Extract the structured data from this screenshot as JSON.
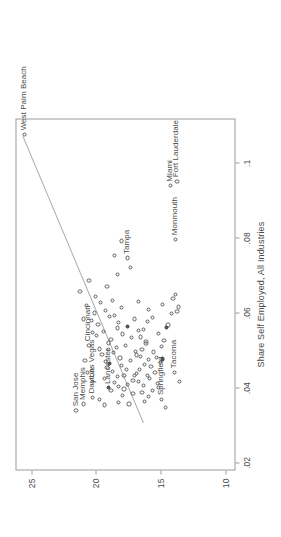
{
  "chart_data": {
    "type": "scatter",
    "title": "",
    "subtitle": "",
    "xlabel": "Share Self Employed, All Industries",
    "ylabel": "",
    "xlim": [
      0.018,
      0.112
    ],
    "ylim": [
      9.2,
      26.2
    ],
    "grid": false,
    "legend": null,
    "xticks": [
      0.02,
      0.04,
      0.06,
      0.08,
      0.1
    ],
    "xticklabels": [
      ".02",
      ".04",
      ".06",
      ".08",
      ".1"
    ],
    "yticks": [
      10,
      15,
      20,
      25
    ],
    "yticklabels": [
      "10",
      "15",
      "20",
      "25"
    ],
    "fit_line": {
      "type": "linear",
      "x": [
        0.0305,
        0.1075
      ],
      "y": [
        16.3,
        25.7
      ],
      "color": "#9b9b9b"
    },
    "annotations": [
      {
        "label": "San Jose",
        "x": 0.0338,
        "y": 21.6,
        "pos": "right"
      },
      {
        "label": "Memphis",
        "x": 0.0355,
        "y": 21.0,
        "pos": "right"
      },
      {
        "label": "Dayton",
        "x": 0.0372,
        "y": 20.3,
        "pos": "right"
      },
      {
        "label": "Las Vegas",
        "x": 0.0415,
        "y": 20.3,
        "pos": "right"
      },
      {
        "label": "Lancaster",
        "x": 0.0398,
        "y": 19.1,
        "pos": "right"
      },
      {
        "label": "Cincinnati",
        "x": 0.0512,
        "y": 20.6,
        "pos": "right"
      },
      {
        "label": "Springfield",
        "x": 0.0368,
        "y": 15.0,
        "pos": "right"
      },
      {
        "label": "Tacoma",
        "x": 0.044,
        "y": 14.0,
        "pos": "right"
      },
      {
        "label": "Tampa",
        "x": 0.0745,
        "y": 17.6,
        "pos": "right"
      },
      {
        "label": "Monmouth",
        "x": 0.0795,
        "y": 13.9,
        "pos": "right"
      },
      {
        "label": "Miami",
        "x": 0.0938,
        "y": 14.3,
        "pos": "right"
      },
      {
        "label": "Fort Lauderdale",
        "x": 0.095,
        "y": 13.8,
        "pos": "right"
      },
      {
        "label": "West Palm Beach",
        "x": 0.1075,
        "y": 25.6,
        "pos": "right"
      }
    ],
    "points": [
      {
        "x": 0.0338,
        "y": 21.6
      },
      {
        "x": 0.0355,
        "y": 21.0
      },
      {
        "x": 0.0372,
        "y": 20.3
      },
      {
        "x": 0.0415,
        "y": 20.3
      },
      {
        "x": 0.0398,
        "y": 19.1,
        "filled": true
      },
      {
        "x": 0.0512,
        "y": 20.6
      },
      {
        "x": 0.0368,
        "y": 15.0
      },
      {
        "x": 0.044,
        "y": 14.0
      },
      {
        "x": 0.0745,
        "y": 17.6
      },
      {
        "x": 0.0795,
        "y": 13.9
      },
      {
        "x": 0.0938,
        "y": 14.3
      },
      {
        "x": 0.095,
        "y": 13.8
      },
      {
        "x": 0.1075,
        "y": 25.6
      },
      {
        "x": 0.0355,
        "y": 17.5
      },
      {
        "x": 0.0362,
        "y": 16.3
      },
      {
        "x": 0.0378,
        "y": 18.0
      },
      {
        "x": 0.0382,
        "y": 17.2
      },
      {
        "x": 0.039,
        "y": 18.9
      },
      {
        "x": 0.0395,
        "y": 17.9
      },
      {
        "x": 0.0402,
        "y": 18.3
      },
      {
        "x": 0.0408,
        "y": 17.6
      },
      {
        "x": 0.0412,
        "y": 18.6
      },
      {
        "x": 0.0418,
        "y": 17.2
      },
      {
        "x": 0.0422,
        "y": 19.4
      },
      {
        "x": 0.0428,
        "y": 18.4
      },
      {
        "x": 0.0432,
        "y": 17.1
      },
      {
        "x": 0.0436,
        "y": 16.9
      },
      {
        "x": 0.0442,
        "y": 18.8
      },
      {
        "x": 0.0448,
        "y": 17.7
      },
      {
        "x": 0.0452,
        "y": 19.2
      },
      {
        "x": 0.0458,
        "y": 18.1
      },
      {
        "x": 0.0462,
        "y": 19.0,
        "filled": true
      },
      {
        "x": 0.0468,
        "y": 19.3
      },
      {
        "x": 0.0472,
        "y": 17.4
      },
      {
        "x": 0.0478,
        "y": 18.2
      },
      {
        "x": 0.0482,
        "y": 16.6
      },
      {
        "x": 0.0488,
        "y": 19.6
      },
      {
        "x": 0.0492,
        "y": 18.7
      },
      {
        "x": 0.0496,
        "y": 17.0
      },
      {
        "x": 0.0502,
        "y": 19.8
      },
      {
        "x": 0.0506,
        "y": 18.5
      },
      {
        "x": 0.0512,
        "y": 17.8
      },
      {
        "x": 0.0518,
        "y": 19.1
      },
      {
        "x": 0.0522,
        "y": 16.2
      },
      {
        "x": 0.0528,
        "y": 18.9
      },
      {
        "x": 0.0532,
        "y": 17.3
      },
      {
        "x": 0.0538,
        "y": 20.0
      },
      {
        "x": 0.0542,
        "y": 18.0
      },
      {
        "x": 0.0548,
        "y": 19.5
      },
      {
        "x": 0.0552,
        "y": 16.8
      },
      {
        "x": 0.0558,
        "y": 18.4
      },
      {
        "x": 0.0562,
        "y": 17.6,
        "filled": true
      },
      {
        "x": 0.0568,
        "y": 19.9
      },
      {
        "x": 0.0572,
        "y": 18.3
      },
      {
        "x": 0.0578,
        "y": 20.4
      },
      {
        "x": 0.0582,
        "y": 17.1
      },
      {
        "x": 0.0588,
        "y": 19.0
      },
      {
        "x": 0.0592,
        "y": 18.6
      },
      {
        "x": 0.0598,
        "y": 20.2
      },
      {
        "x": 0.0605,
        "y": 19.3
      },
      {
        "x": 0.0612,
        "y": 18.1
      },
      {
        "x": 0.0618,
        "y": 20.8
      },
      {
        "x": 0.0625,
        "y": 19.7
      },
      {
        "x": 0.0632,
        "y": 18.8
      },
      {
        "x": 0.0642,
        "y": 20.1
      },
      {
        "x": 0.0655,
        "y": 21.3
      },
      {
        "x": 0.0668,
        "y": 19.2
      },
      {
        "x": 0.0685,
        "y": 20.6
      },
      {
        "x": 0.0352,
        "y": 19.4
      },
      {
        "x": 0.036,
        "y": 18.3
      },
      {
        "x": 0.0366,
        "y": 19.8
      },
      {
        "x": 0.0374,
        "y": 16.0
      },
      {
        "x": 0.0386,
        "y": 16.5
      },
      {
        "x": 0.0392,
        "y": 15.7
      },
      {
        "x": 0.0404,
        "y": 16.4
      },
      {
        "x": 0.041,
        "y": 15.3
      },
      {
        "x": 0.0416,
        "y": 16.8
      },
      {
        "x": 0.0424,
        "y": 15.9
      },
      {
        "x": 0.043,
        "y": 16.1
      },
      {
        "x": 0.0438,
        "y": 15.5
      },
      {
        "x": 0.0446,
        "y": 16.7
      },
      {
        "x": 0.0454,
        "y": 15.8
      },
      {
        "x": 0.046,
        "y": 16.3
      },
      {
        "x": 0.0466,
        "y": 15.1
      },
      {
        "x": 0.0474,
        "y": 16.0
      },
      {
        "x": 0.048,
        "y": 15.4
      },
      {
        "x": 0.0486,
        "y": 16.9
      },
      {
        "x": 0.0494,
        "y": 15.6
      },
      {
        "x": 0.05,
        "y": 16.5
      },
      {
        "x": 0.0508,
        "y": 15.0
      },
      {
        "x": 0.0516,
        "y": 16.2
      },
      {
        "x": 0.0524,
        "y": 14.8
      },
      {
        "x": 0.0534,
        "y": 16.6
      },
      {
        "x": 0.0544,
        "y": 15.2
      },
      {
        "x": 0.0554,
        "y": 16.4
      },
      {
        "x": 0.0566,
        "y": 14.5
      },
      {
        "x": 0.0576,
        "y": 16.1
      },
      {
        "x": 0.0586,
        "y": 15.7
      },
      {
        "x": 0.0596,
        "y": 14.2
      },
      {
        "x": 0.0608,
        "y": 16.0
      },
      {
        "x": 0.062,
        "y": 14.9
      },
      {
        "x": 0.0636,
        "y": 14.1
      },
      {
        "x": 0.0648,
        "y": 13.9
      },
      {
        "x": 0.0415,
        "y": 13.6
      },
      {
        "x": 0.0475,
        "y": 14.9,
        "filled": true
      },
      {
        "x": 0.056,
        "y": 14.6,
        "filled": true
      },
      {
        "x": 0.0602,
        "y": 13.8
      },
      {
        "x": 0.0614,
        "y": 13.7
      },
      {
        "x": 0.0628,
        "y": 16.8
      },
      {
        "x": 0.07,
        "y": 18.4
      },
      {
        "x": 0.072,
        "y": 17.4
      },
      {
        "x": 0.0752,
        "y": 18.6
      },
      {
        "x": 0.079,
        "y": 18.1
      },
      {
        "x": 0.0345,
        "y": 14.7
      },
      {
        "x": 0.0398,
        "y": 15.2
      },
      {
        "x": 0.043,
        "y": 17.9
      },
      {
        "x": 0.05,
        "y": 19.1
      },
      {
        "x": 0.0545,
        "y": 20.3
      },
      {
        "x": 0.0582,
        "y": 21.0
      },
      {
        "x": 0.047,
        "y": 20.9
      },
      {
        "x": 0.044,
        "y": 20.7
      }
    ]
  }
}
